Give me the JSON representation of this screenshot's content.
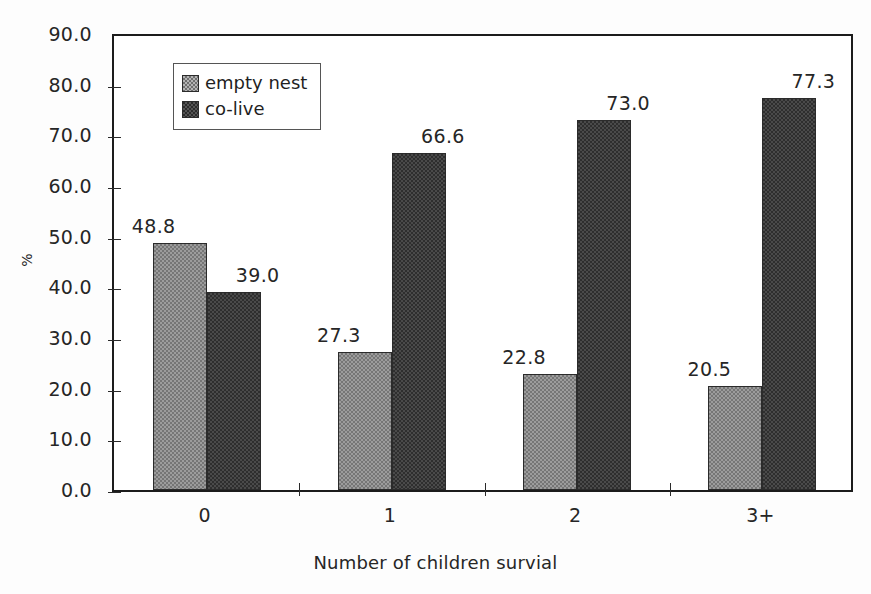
{
  "chart_data": {
    "type": "bar",
    "title": "",
    "xlabel": "Number of children survial",
    "ylabel": "%",
    "categories": [
      "0",
      "1",
      "2",
      "3+"
    ],
    "series": [
      {
        "name": "empty nest",
        "values": [
          48.8,
          27.3,
          22.8,
          20.5
        ],
        "color": "#9c9c9c",
        "pattern": "fine-checkerboard-light"
      },
      {
        "name": "co-live",
        "values": [
          39.0,
          66.6,
          73.0,
          77.3
        ],
        "color": "#2e2e2e",
        "pattern": "fine-checkerboard-dark"
      }
    ],
    "ylim": [
      0.0,
      90.0
    ],
    "ytick_step": 10.0,
    "ytick_labels": [
      "90.0",
      "80.0",
      "70.0",
      "60.0",
      "50.0",
      "40.0",
      "30.0",
      "20.0",
      "10.0",
      "0.0"
    ],
    "data_labels": [
      "48.8",
      "39.0",
      "27.3",
      "66.6",
      "22.8",
      "73.0",
      "20.5",
      "77.3"
    ],
    "grid": false,
    "legend_position": "top-left-inside",
    "legend_entries": [
      "empty nest",
      "co-live"
    ],
    "axis_frame": "full-box",
    "data_labels_shown": true
  }
}
